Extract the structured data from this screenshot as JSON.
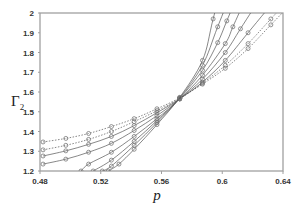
{
  "chart_data": {
    "type": "line",
    "title": "",
    "xlabel": "p",
    "ylabel": "Γ2",
    "xlim": [
      0.48,
      0.64
    ],
    "ylim": [
      1.2,
      2.0
    ],
    "xticks": [
      "0.48",
      "0.52",
      "0.56",
      "0.6",
      "0.64"
    ],
    "yticks": [
      "1.2",
      "1.3",
      "1.4",
      "1.5",
      "1.6",
      "1.7",
      "1.8",
      "1.9",
      "2"
    ],
    "grid": false,
    "legend": "none",
    "marker": "open-circle",
    "crossing_point": {
      "p": 0.575,
      "gamma": 1.58
    },
    "series": [
      {
        "name": "s1",
        "style": "dotted",
        "x": [
          0.482,
          0.497,
          0.512,
          0.527,
          0.542,
          0.557,
          0.572,
          0.587,
          0.602,
          0.617,
          0.632
        ],
        "values": [
          1.347,
          1.365,
          1.39,
          1.425,
          1.465,
          1.515,
          1.57,
          1.64,
          1.72,
          1.82,
          1.94
        ]
      },
      {
        "name": "s2",
        "style": "dotted",
        "x": [
          0.482,
          0.497,
          0.512,
          0.527,
          0.542,
          0.557,
          0.572,
          0.587,
          0.602,
          0.617,
          0.632
        ],
        "values": [
          1.307,
          1.33,
          1.36,
          1.4,
          1.45,
          1.505,
          1.567,
          1.645,
          1.735,
          1.845,
          1.97
        ]
      },
      {
        "name": "s3",
        "style": "solid",
        "x": [
          0.482,
          0.497,
          0.512,
          0.527,
          0.542,
          0.557,
          0.572,
          0.587,
          0.602,
          0.617
        ],
        "values": [
          1.276,
          1.302,
          1.335,
          1.375,
          1.43,
          1.495,
          1.565,
          1.65,
          1.76,
          1.9
        ]
      },
      {
        "name": "s4",
        "style": "solid",
        "x": [
          0.482,
          0.497,
          0.512,
          0.527,
          0.542,
          0.557,
          0.572,
          0.587,
          0.602,
          0.612
        ],
        "values": [
          1.235,
          1.26,
          1.295,
          1.34,
          1.405,
          1.48,
          1.565,
          1.665,
          1.8,
          1.92
        ]
      },
      {
        "name": "s5",
        "style": "solid",
        "x": [
          0.507,
          0.512,
          0.527,
          0.542,
          0.557,
          0.572,
          0.587,
          0.602,
          0.607
        ],
        "values": [
          1.2,
          1.235,
          1.295,
          1.375,
          1.465,
          1.565,
          1.685,
          1.845,
          1.93
        ]
      },
      {
        "name": "s6",
        "style": "solid",
        "x": [
          0.515,
          0.527,
          0.542,
          0.557,
          0.572,
          0.587,
          0.597,
          0.603
        ],
        "values": [
          1.2,
          1.255,
          1.35,
          1.455,
          1.568,
          1.71,
          1.85,
          1.96
        ]
      },
      {
        "name": "s7",
        "style": "solid",
        "x": [
          0.521,
          0.527,
          0.542,
          0.557,
          0.572,
          0.587,
          0.597
        ],
        "values": [
          1.2,
          1.225,
          1.33,
          1.445,
          1.57,
          1.735,
          1.93
        ]
      },
      {
        "name": "s8",
        "style": "solid",
        "x": [
          0.525,
          0.532,
          0.542,
          0.557,
          0.572,
          0.587,
          0.594
        ],
        "values": [
          1.2,
          1.235,
          1.31,
          1.435,
          1.573,
          1.76,
          1.97
        ]
      }
    ]
  },
  "axes": {
    "xlabel": "p",
    "ylabel_main": "Γ",
    "ylabel_sub": "2"
  },
  "colors": {
    "axis": "#a0a0a0",
    "line": "#555555",
    "marker": "#777777",
    "text": "#333333"
  }
}
